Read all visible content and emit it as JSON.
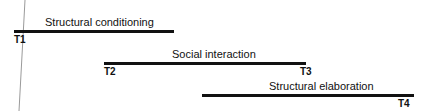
{
  "diagram": {
    "phases": [
      {
        "label": "Structural conditioning",
        "start": "T1",
        "end": ""
      },
      {
        "label": "Social interaction",
        "start": "T2",
        "end": "T3"
      },
      {
        "label": "Structural elaboration",
        "start": "",
        "end": "T4"
      }
    ]
  }
}
